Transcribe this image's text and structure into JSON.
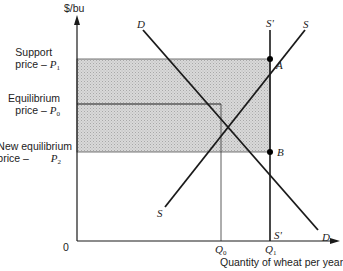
{
  "axes": {
    "y_label": "$/bu",
    "x_label": "Quantity of wheat per year",
    "origin_label": "0"
  },
  "price_levels": [
    {
      "id": "support",
      "line1": "Support",
      "line2": "price –",
      "symbol": "P",
      "sub": "1"
    },
    {
      "id": "equilibrium",
      "line1": "Equilibrium",
      "line2": "price –",
      "symbol": "P",
      "sub": "0"
    },
    {
      "id": "new_equilibrium",
      "line1": "New equilibrium",
      "line2": "price –",
      "symbol": "P",
      "sub": "2"
    }
  ],
  "quantity_levels": [
    {
      "id": "q0",
      "symbol": "Q",
      "sub": "0"
    },
    {
      "id": "q1",
      "symbol": "Q",
      "sub": "1"
    }
  ],
  "curves": {
    "demand": {
      "label_top": "D",
      "label_bottom": "D"
    },
    "supply": {
      "label_top": "S",
      "label_bottom": "S"
    },
    "supply_vertical": {
      "label_top": "S'",
      "label_bottom": "S'"
    }
  },
  "points": {
    "A": "A",
    "B": "B"
  },
  "colors": {
    "line": "#1a1a1a",
    "shade": "#cfcfcf",
    "background": "#ffffff"
  }
}
